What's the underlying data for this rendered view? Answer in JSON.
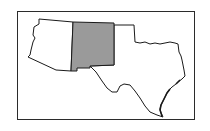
{
  "map": {
    "region": "Southwestern United States",
    "highlighted_state": "New Mexico",
    "colors": {
      "highlight_fill": "#9a9a9a",
      "default_fill": "#ffffff",
      "outline": "#1a1a1a",
      "frame": "#2b2b2b",
      "background": "#ffffff"
    },
    "states": [
      {
        "name": "Arizona",
        "highlighted": false
      },
      {
        "name": "New Mexico",
        "highlighted": true
      },
      {
        "name": "Oklahoma",
        "highlighted": false
      },
      {
        "name": "Texas",
        "highlighted": false
      }
    ]
  }
}
